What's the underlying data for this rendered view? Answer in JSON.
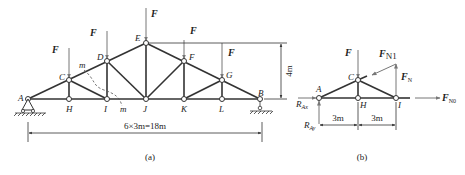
{
  "figure_a": {
    "caption": "(a)",
    "nodes": [
      {
        "id": "A",
        "label": "A",
        "x": 28,
        "y": 99
      },
      {
        "id": "H",
        "label": "H",
        "x": 69,
        "y": 99
      },
      {
        "id": "I",
        "label": "I",
        "x": 107,
        "y": 99
      },
      {
        "id": "J",
        "label": "J",
        "x": 146,
        "y": 99
      },
      {
        "id": "K",
        "label": "K",
        "x": 184,
        "y": 99
      },
      {
        "id": "L",
        "label": "L",
        "x": 222,
        "y": 99
      },
      {
        "id": "B",
        "label": "B",
        "x": 260,
        "y": 99
      },
      {
        "id": "C",
        "label": "C",
        "x": 69,
        "y": 80
      },
      {
        "id": "D",
        "label": "D",
        "x": 107,
        "y": 61
      },
      {
        "id": "E",
        "label": "E",
        "x": 146,
        "y": 43
      },
      {
        "id": "F",
        "label": "F",
        "x": 184,
        "y": 61
      },
      {
        "id": "G",
        "label": "G",
        "x": 222,
        "y": 80
      }
    ],
    "loads": [
      {
        "at": "C",
        "label": "F"
      },
      {
        "at": "D",
        "label": "F"
      },
      {
        "at": "E",
        "label": "F"
      },
      {
        "at": "F",
        "label": "F"
      },
      {
        "at": "G",
        "label": "F"
      }
    ],
    "section_label": "m",
    "span_dimension": "6×3m=18m",
    "height_dimension": "4m"
  },
  "figure_b": {
    "caption": "(b)",
    "nodes": [
      {
        "id": "A",
        "label": "A"
      },
      {
        "id": "C",
        "label": "C"
      },
      {
        "id": "H",
        "label": "H"
      },
      {
        "id": "I",
        "label": "I"
      }
    ],
    "load_label": "F",
    "force_N1": {
      "base": "F",
      "sub": "N1"
    },
    "force_N": {
      "base": "F",
      "sub": "N"
    },
    "force_N0": {
      "base": "F",
      "sub": "N0"
    },
    "reaction_x": {
      "base": "R",
      "sub": "Ax"
    },
    "reaction_y": {
      "base": "R",
      "sub": "Ay"
    },
    "dim_left": "3m",
    "dim_right": "3m"
  }
}
